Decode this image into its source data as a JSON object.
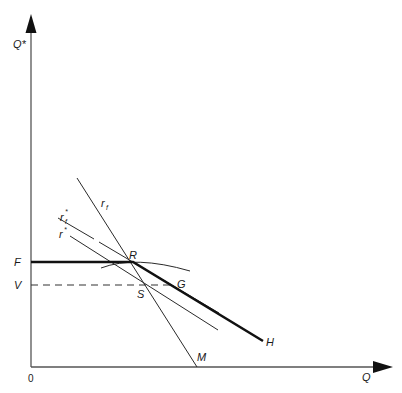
{
  "diagram": {
    "axes": {
      "y_label": "Q*",
      "x_label": "Q",
      "origin_label": "0"
    },
    "levels": {
      "F": "F",
      "V": "V"
    },
    "points": {
      "R": "R",
      "S": "S",
      "G": "G",
      "H": "H",
      "M": "M"
    },
    "curves": {
      "r_f": {
        "base": "r",
        "sub": "f"
      },
      "r_f_star": {
        "base": "r",
        "sup": "*",
        "sub": "f"
      },
      "r_star": {
        "base": "r",
        "sup": "*"
      }
    },
    "colors": {
      "line": "#111111",
      "axis": "#555555",
      "background": "#ffffff"
    }
  }
}
